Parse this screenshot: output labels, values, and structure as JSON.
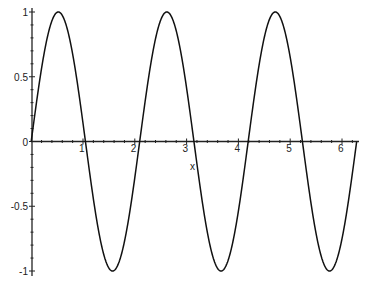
{
  "chart_data": {
    "type": "line",
    "title": "",
    "xlabel": "x",
    "ylabel": "",
    "function": "sin(3x)",
    "xlim": [
      0,
      6.2832
    ],
    "ylim": [
      -1,
      1
    ],
    "grid": false,
    "legend": null,
    "x_ticks": [
      "1",
      "2",
      "3",
      "4",
      "5",
      "6"
    ],
    "y_ticks": [
      "-1",
      "-0.5",
      "0",
      "0.5",
      "1"
    ],
    "series": [
      {
        "name": "sin(3x)",
        "x": [
          0,
          0.5236,
          1.0472,
          1.5708,
          2.0944,
          2.618,
          3.1416,
          3.6652,
          4.1888,
          4.7124,
          5.236,
          5.7596,
          6.2832
        ],
        "values": [
          0,
          1,
          0,
          -1,
          0,
          1,
          0,
          -1,
          0,
          1,
          0,
          -1,
          0
        ]
      }
    ],
    "color": "#000000"
  },
  "axes": {
    "x_label": "x",
    "origin_label": "0"
  }
}
